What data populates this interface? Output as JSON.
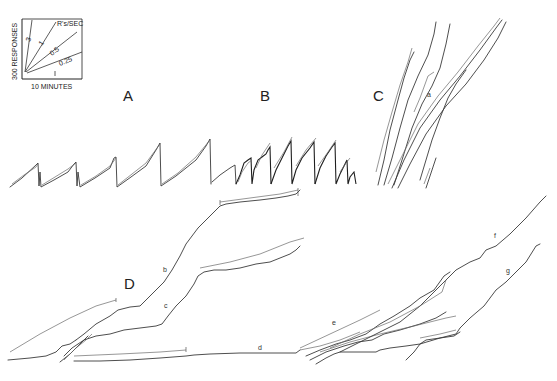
{
  "figure": {
    "panel_labels": {
      "A": "A",
      "B": "B",
      "C": "C",
      "D": "D"
    },
    "curve_labels": {
      "a": "a",
      "b": "b",
      "c": "c",
      "d": "d",
      "e": "e",
      "f": "f",
      "g": "g"
    },
    "scale_key": {
      "y_axis_label": "300 RESPONSES",
      "x_axis_label": "10 MINUTES",
      "rate_header": "R's/SEC",
      "rates": [
        "3",
        "1",
        "0.5",
        "0.25"
      ]
    },
    "colors": {
      "background": "#ffffff",
      "ink": "#2a2a2a"
    }
  }
}
